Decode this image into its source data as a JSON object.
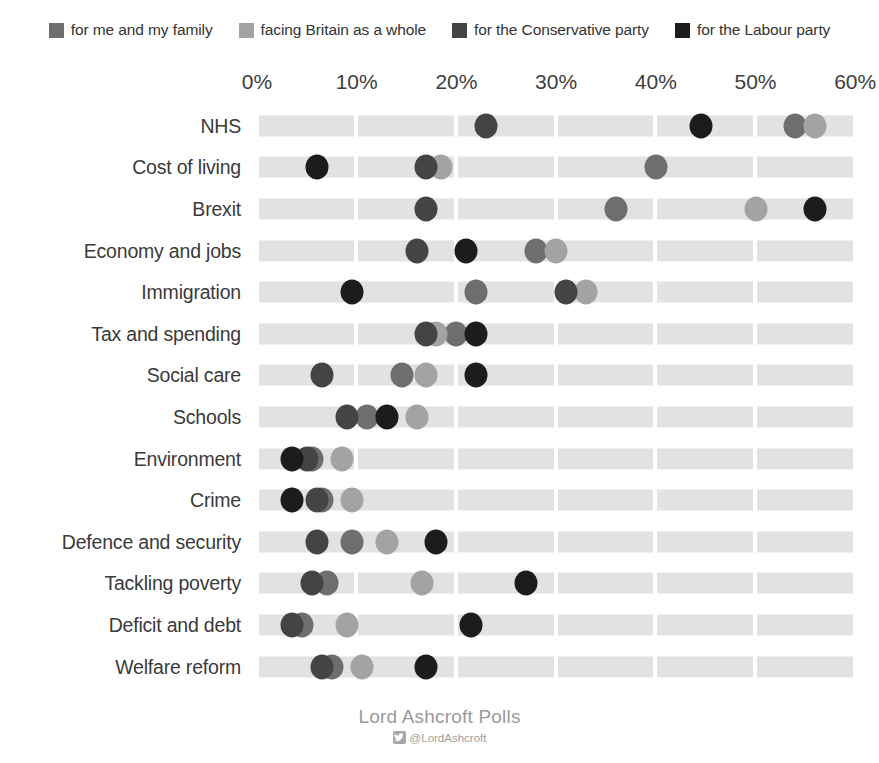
{
  "legend": {
    "items": [
      {
        "label": "for me and my family",
        "color": "#6e6e6e",
        "key": "me_family"
      },
      {
        "label": "facing Britain as a whole",
        "color": "#a3a3a3",
        "key": "britain"
      },
      {
        "label": "for the Conservative party",
        "color": "#444444",
        "key": "conservative"
      },
      {
        "label": "for the Labour party",
        "color": "#1c1c1c",
        "key": "labour"
      }
    ]
  },
  "footer": {
    "title": "Lord Ashcroft Polls",
    "handle": "@LordAshcroft",
    "icon": "twitter-icon"
  },
  "chart_data": {
    "type": "scatter",
    "title": "",
    "subtitle": "",
    "xlabel": "",
    "ylabel": "",
    "xlim": [
      0,
      60
    ],
    "xtick_labels": [
      "0%",
      "10%",
      "20%",
      "30%",
      "40%",
      "50%",
      "60%"
    ],
    "xticks": [
      0,
      10,
      20,
      30,
      40,
      50,
      60
    ],
    "grid": false,
    "bands": true,
    "legend_position": "top",
    "orientation": "horizontal",
    "categories": [
      "NHS",
      "Cost of living",
      "Brexit",
      "Economy and jobs",
      "Immigration",
      "Tax and spending",
      "Social care",
      "Schools",
      "Environment",
      "Crime",
      "Defence and security",
      "Tackling poverty",
      "Deficit and debt",
      "Welfare reform"
    ],
    "series": [
      {
        "name": "for me and my family",
        "key": "me_family",
        "color": "#6e6e6e",
        "values": [
          54,
          40,
          36,
          28,
          22,
          20,
          14.5,
          11,
          5.5,
          6.5,
          9.5,
          7,
          4.5,
          7.5
        ]
      },
      {
        "name": "facing Britain as a whole",
        "key": "britain",
        "color": "#a3a3a3",
        "values": [
          56,
          18.5,
          50,
          30,
          33,
          18,
          17,
          16,
          8.5,
          9.5,
          13,
          16.5,
          9,
          10.5
        ]
      },
      {
        "name": "for the Conservative party",
        "key": "conservative",
        "color": "#444444",
        "values": [
          23,
          17,
          17,
          16,
          31,
          17,
          6.5,
          9,
          5,
          6,
          6,
          5.5,
          3.5,
          6.5
        ],
        "note": "dark grey markers"
      },
      {
        "name": "for the Labour party",
        "key": "labour",
        "color": "#1c1c1c",
        "values": [
          44.5,
          6,
          56,
          21,
          9.5,
          22,
          22,
          13,
          3.5,
          3.5,
          18,
          27,
          21.5,
          17
        ]
      }
    ]
  }
}
